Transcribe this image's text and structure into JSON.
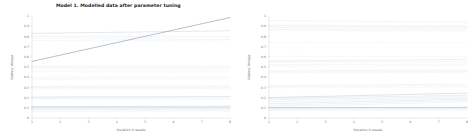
{
  "figure": {
    "background": "#ffffff",
    "panels": [
      {
        "id": "left",
        "title": "Model 1. Modelled data after parameter tuning",
        "has_title": true
      },
      {
        "id": "right",
        "title": "",
        "has_title": false
      }
    ]
  },
  "chart_data": [
    {
      "type": "line",
      "panel": "left",
      "title": "Model 1. Modelled data after parameter tuning",
      "xlabel": "Duration in weeks",
      "ylabel": "Battery Voltage",
      "xlim": [
        1,
        8
      ],
      "ylim": [
        0,
        1
      ],
      "xticks": [
        1,
        2,
        3,
        4,
        5,
        6,
        7,
        8
      ],
      "xticklabels": [
        "1",
        "2",
        "3",
        "4",
        "5",
        "6",
        "7",
        "8"
      ],
      "yticks": [
        0,
        0.1,
        0.2,
        0.3,
        0.4,
        0.5,
        0.6,
        0.7,
        0.8,
        0.9,
        1
      ],
      "yticklabels": [
        "0",
        "0.1",
        "0.2",
        "0.3",
        "0.4",
        "0.5",
        "0.6",
        "0.7",
        "0.8",
        "0.9",
        "1"
      ],
      "grid": false,
      "legend": "none",
      "line_color": "#8a9fb5",
      "x": [
        1,
        8
      ],
      "series": [
        {
          "name": "trace-01",
          "values": [
            0.555,
            0.985
          ],
          "width": 0.85,
          "opacity": 0.75
        },
        {
          "name": "trace-02",
          "values": [
            0.83,
            0.855
          ],
          "width": 0.5,
          "opacity": 0.45
        },
        {
          "name": "trace-03",
          "values": [
            0.8,
            0.795
          ],
          "width": 0.4,
          "opacity": 0.3
        },
        {
          "name": "trace-04",
          "values": [
            0.782,
            0.772
          ],
          "width": 0.4,
          "opacity": 0.22
        },
        {
          "name": "trace-05",
          "values": [
            0.76,
            0.765
          ],
          "width": 0.4,
          "opacity": 0.18
        },
        {
          "name": "trace-06",
          "values": [
            0.505,
            0.505
          ],
          "width": 0.4,
          "opacity": 0.26
        },
        {
          "name": "trace-07",
          "values": [
            0.492,
            0.488
          ],
          "width": 0.4,
          "opacity": 0.2
        },
        {
          "name": "trace-08",
          "values": [
            0.47,
            0.47
          ],
          "width": 0.4,
          "opacity": 0.16
        },
        {
          "name": "trace-09",
          "values": [
            0.455,
            0.452
          ],
          "width": 0.4,
          "opacity": 0.14
        },
        {
          "name": "trace-10",
          "values": [
            0.395,
            0.4
          ],
          "width": 0.4,
          "opacity": 0.22
        },
        {
          "name": "trace-11",
          "values": [
            0.38,
            0.378
          ],
          "width": 0.4,
          "opacity": 0.16
        },
        {
          "name": "trace-12",
          "values": [
            0.31,
            0.315
          ],
          "width": 0.45,
          "opacity": 0.3
        },
        {
          "name": "trace-13",
          "values": [
            0.3,
            0.298
          ],
          "width": 0.4,
          "opacity": 0.2
        },
        {
          "name": "trace-14",
          "values": [
            0.292,
            0.288
          ],
          "width": 0.4,
          "opacity": 0.15
        },
        {
          "name": "trace-15",
          "values": [
            0.205,
            0.21
          ],
          "width": 0.55,
          "opacity": 0.42
        },
        {
          "name": "trace-16",
          "values": [
            0.196,
            0.198
          ],
          "width": 0.4,
          "opacity": 0.25
        },
        {
          "name": "trace-17",
          "values": [
            0.186,
            0.184
          ],
          "width": 0.4,
          "opacity": 0.18
        },
        {
          "name": "trace-18",
          "values": [
            0.112,
            0.115
          ],
          "width": 0.6,
          "opacity": 0.5
        },
        {
          "name": "trace-19",
          "values": [
            0.103,
            0.104
          ],
          "width": 0.5,
          "opacity": 0.4
        },
        {
          "name": "trace-20",
          "values": [
            0.096,
            0.096
          ],
          "width": 0.45,
          "opacity": 0.32
        },
        {
          "name": "trace-21",
          "values": [
            0.088,
            0.09
          ],
          "width": 0.4,
          "opacity": 0.26
        },
        {
          "name": "trace-22",
          "values": [
            0.08,
            0.082
          ],
          "width": 0.4,
          "opacity": 0.2
        },
        {
          "name": "trace-23",
          "values": [
            0.072,
            0.074
          ],
          "width": 0.4,
          "opacity": 0.16
        },
        {
          "name": "trace-24",
          "values": [
            0.062,
            0.064
          ],
          "width": 0.4,
          "opacity": 0.14
        }
      ]
    },
    {
      "type": "line",
      "panel": "right",
      "title": "",
      "xlabel": "Duration in weeks",
      "ylabel": "Battery Voltage",
      "xlim": [
        1,
        8
      ],
      "ylim": [
        0,
        1
      ],
      "xticks": [
        1,
        2,
        3,
        4,
        5,
        6,
        7,
        8
      ],
      "xticklabels": [
        "1",
        "2",
        "3",
        "4",
        "5",
        "6",
        "7",
        "8"
      ],
      "yticks": [
        0,
        0.1,
        0.2,
        0.3,
        0.4,
        0.5,
        0.6,
        0.7,
        0.8,
        0.9,
        1
      ],
      "yticklabels": [
        "0",
        "0.1",
        "0.2",
        "0.3",
        "0.4",
        "0.5",
        "0.6",
        "0.7",
        "0.8",
        "0.9",
        "1"
      ],
      "grid": false,
      "legend": "none",
      "line_color": "#8a9fb5",
      "x": [
        1,
        8
      ],
      "series": [
        {
          "name": "trace-01",
          "values": [
            0.955,
            0.94
          ],
          "width": 0.45,
          "opacity": 0.26
        },
        {
          "name": "trace-02",
          "values": [
            0.905,
            0.898
          ],
          "width": 0.5,
          "opacity": 0.34
        },
        {
          "name": "trace-03",
          "values": [
            0.888,
            0.88
          ],
          "width": 0.45,
          "opacity": 0.26
        },
        {
          "name": "trace-04",
          "values": [
            0.87,
            0.862
          ],
          "width": 0.4,
          "opacity": 0.2
        },
        {
          "name": "trace-05",
          "values": [
            0.862,
            0.852
          ],
          "width": 0.4,
          "opacity": 0.16
        },
        {
          "name": "trace-06",
          "values": [
            0.742,
            0.74
          ],
          "width": 0.4,
          "opacity": 0.14
        },
        {
          "name": "trace-07",
          "values": [
            0.605,
            0.602
          ],
          "width": 0.4,
          "opacity": 0.18
        },
        {
          "name": "trace-08",
          "values": [
            0.56,
            0.575
          ],
          "width": 0.5,
          "opacity": 0.3
        },
        {
          "name": "trace-09",
          "values": [
            0.548,
            0.556
          ],
          "width": 0.45,
          "opacity": 0.24
        },
        {
          "name": "trace-10",
          "values": [
            0.524,
            0.53
          ],
          "width": 0.4,
          "opacity": 0.22
        },
        {
          "name": "trace-11",
          "values": [
            0.508,
            0.512
          ],
          "width": 0.4,
          "opacity": 0.18
        },
        {
          "name": "trace-12",
          "values": [
            0.462,
            0.47
          ],
          "width": 0.45,
          "opacity": 0.26
        },
        {
          "name": "trace-13",
          "values": [
            0.452,
            0.456
          ],
          "width": 0.4,
          "opacity": 0.2
        },
        {
          "name": "trace-14",
          "values": [
            0.443,
            0.446
          ],
          "width": 0.4,
          "opacity": 0.15
        },
        {
          "name": "trace-15",
          "values": [
            0.318,
            0.332
          ],
          "width": 0.45,
          "opacity": 0.26
        },
        {
          "name": "trace-16",
          "values": [
            0.306,
            0.316
          ],
          "width": 0.4,
          "opacity": 0.2
        },
        {
          "name": "trace-17",
          "values": [
            0.296,
            0.302
          ],
          "width": 0.4,
          "opacity": 0.16
        },
        {
          "name": "trace-18",
          "values": [
            0.2,
            0.244
          ],
          "width": 0.6,
          "opacity": 0.48
        },
        {
          "name": "trace-19",
          "values": [
            0.192,
            0.222
          ],
          "width": 0.5,
          "opacity": 0.36
        },
        {
          "name": "trace-20",
          "values": [
            0.178,
            0.208
          ],
          "width": 0.45,
          "opacity": 0.3
        },
        {
          "name": "trace-21",
          "values": [
            0.16,
            0.196
          ],
          "width": 0.45,
          "opacity": 0.26
        },
        {
          "name": "trace-22",
          "values": [
            0.14,
            0.186
          ],
          "width": 0.5,
          "opacity": 0.34
        },
        {
          "name": "trace-23",
          "values": [
            0.124,
            0.172
          ],
          "width": 0.45,
          "opacity": 0.28
        },
        {
          "name": "trace-24",
          "values": [
            0.108,
            0.158
          ],
          "width": 0.45,
          "opacity": 0.24
        },
        {
          "name": "trace-25",
          "values": [
            0.102,
            0.104
          ],
          "width": 0.7,
          "opacity": 0.6
        },
        {
          "name": "trace-26",
          "values": [
            0.096,
            0.098
          ],
          "width": 0.5,
          "opacity": 0.38
        },
        {
          "name": "trace-27",
          "values": [
            0.086,
            0.09
          ],
          "width": 0.45,
          "opacity": 0.28
        },
        {
          "name": "trace-28",
          "values": [
            0.072,
            0.078
          ],
          "width": 0.4,
          "opacity": 0.2
        }
      ]
    }
  ]
}
